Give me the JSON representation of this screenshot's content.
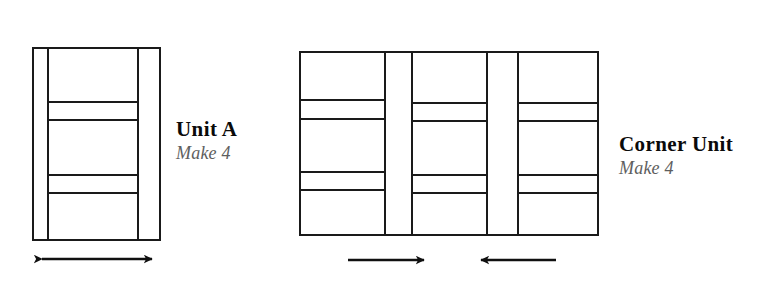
{
  "figure": {
    "kind": "quilt-piecing-diagram",
    "background_color": "#ffffff",
    "line_color": "#1a1a1a",
    "fill_color": "#ffffff"
  },
  "units": [
    {
      "id": "unit-a",
      "title": "Unit A",
      "subtitle": "Make 4",
      "title_color": "#0a0a0a",
      "subtitle_color": "#5e5e5e",
      "grain_arrow": {
        "type": "double-headed",
        "direction": "horizontal",
        "label": ""
      }
    },
    {
      "id": "corner-unit",
      "title": "Corner Unit",
      "subtitle": "Make 4",
      "title_color": "#0a0a0a",
      "subtitle_color": "#5e5e5e",
      "grain_arrow": {
        "type": "two-single-headed-facing-inward",
        "direction": "horizontal",
        "label": ""
      }
    }
  ],
  "geometry": {
    "unit_a": {
      "outer": {
        "x": 33,
        "y": 48,
        "width": 127,
        "height": 192
      },
      "vertical_lines": [
        48,
        138
      ],
      "horizontal_lines": [
        102,
        120,
        175,
        193
      ],
      "horizontal_span": {
        "x1": 48,
        "x2": 138
      },
      "arrow": {
        "y": 259,
        "x1": 33,
        "x2": 161
      }
    },
    "corner_unit": {
      "outer": {
        "x": 300,
        "y": 52,
        "width": 298,
        "height": 183
      },
      "columns": [
        {
          "x1": 300,
          "x2": 385,
          "horizontal_lines": [
            100,
            119,
            172,
            190
          ]
        },
        {
          "x1": 412,
          "x2": 487,
          "horizontal_lines": [
            103,
            121,
            175,
            193
          ]
        },
        {
          "x1": 518,
          "x2": 598,
          "horizontal_lines": [
            103,
            121,
            175,
            193
          ]
        }
      ],
      "sashing_strips": [
        {
          "x1": 385,
          "x2": 412
        },
        {
          "x1": 487,
          "x2": 518
        }
      ],
      "arrows": [
        {
          "y": 260,
          "x1": 348,
          "x2": 433,
          "points": "right"
        },
        {
          "y": 260,
          "x1": 472,
          "x2": 556,
          "points": "left"
        }
      ]
    }
  }
}
